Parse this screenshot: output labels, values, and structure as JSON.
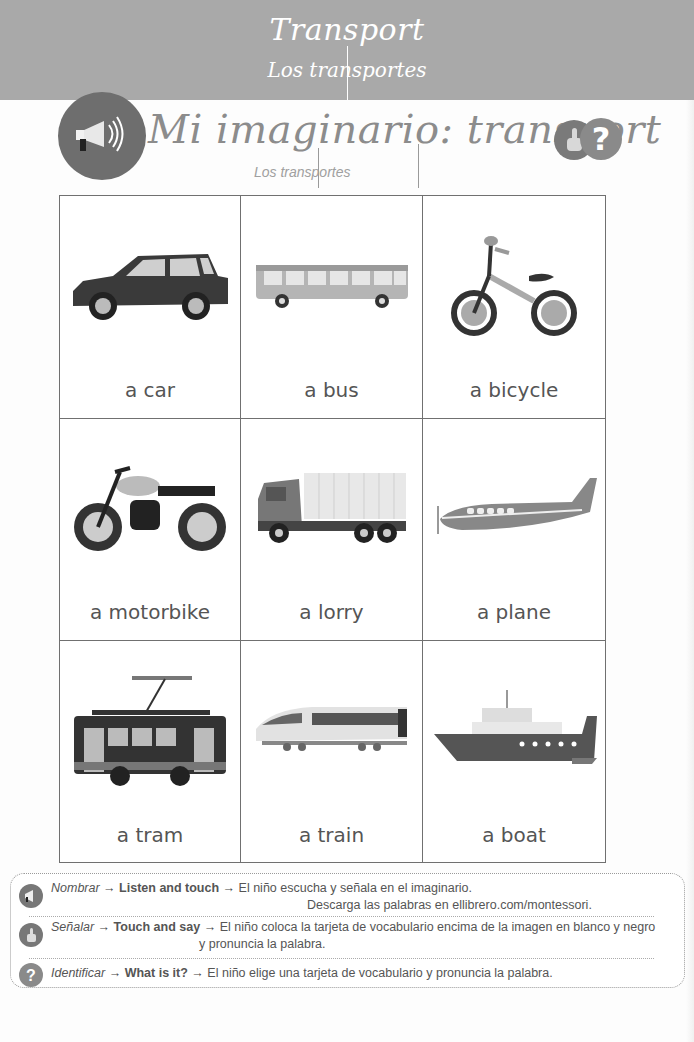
{
  "header": {
    "title": "Transport",
    "subtitle": "Los transportes",
    "background_color": "#a9a9a9"
  },
  "section": {
    "title": "Mi imaginario: transport",
    "subtitle": "Los transportes",
    "icons": [
      "megaphone-icon",
      "pointing-hand-icon",
      "question-icon"
    ],
    "question_glyph": "?"
  },
  "vocabulary": {
    "cards": [
      {
        "label": "a car",
        "icon": "car"
      },
      {
        "label": "a bus",
        "icon": "bus"
      },
      {
        "label": "a bicycle",
        "icon": "bicycle"
      },
      {
        "label": "a motorbike",
        "icon": "motorbike"
      },
      {
        "label": "a lorry",
        "icon": "lorry"
      },
      {
        "label": "a plane",
        "icon": "plane"
      },
      {
        "label": "a tram",
        "icon": "tram"
      },
      {
        "label": "a train",
        "icon": "train"
      },
      {
        "label": "a boat",
        "icon": "boat"
      }
    ]
  },
  "instructions": {
    "rows": [
      {
        "icon": "megaphone-icon",
        "mode": "Nombrar",
        "arrow": "→",
        "action": "Listen and touch",
        "text": "El niño escucha y señala en el imaginario.",
        "text2": "Descarga las palabras en ellibrero.com/montessori."
      },
      {
        "icon": "pointing-hand-icon",
        "mode": "Señalar",
        "arrow": "→",
        "action": "Touch and say",
        "text": "El niño coloca la tarjeta de vocabulario encima de la imagen en blanco y negro",
        "text2": "y pronuncia la palabra."
      },
      {
        "icon": "question-icon",
        "mode": "Identificar",
        "arrow": "→",
        "action": "What is it?",
        "text": "El niño elige una tarjeta de vocabulario y pronuncia la palabra."
      }
    ],
    "question_glyph": "?"
  }
}
